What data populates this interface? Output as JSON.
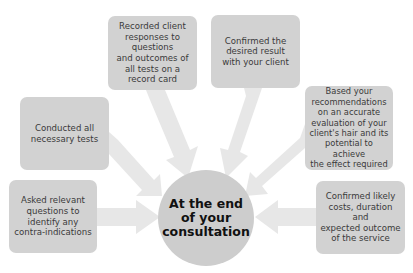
{
  "diagram": {
    "center": {
      "label": "At the end\nof your\nconsultation"
    },
    "nodes": [
      {
        "id": "record-card",
        "label": "Recorded client\nresponses to\nquestions\nand outcomes of\nall tests on a\nrecord card"
      },
      {
        "id": "desired-result",
        "label": "Confirmed the\ndesired result\nwith your client"
      },
      {
        "id": "recommendations",
        "label": "Based your\nrecommendations\non an accurate\nevaluation of your\nclient's hair and its\npotential to achieve\nthe effect required"
      },
      {
        "id": "costs",
        "label": "Confirmed likely\ncosts, duration and\nexpected outcome\nof the service"
      },
      {
        "id": "tests",
        "label": "Conducted all\nnecessary tests"
      },
      {
        "id": "contra-indications",
        "label": "Asked relevant\nquestions to\nidentify any\ncontra-indications"
      }
    ],
    "colors": {
      "box": "#d2d2d2",
      "hub": "#cdcdcd",
      "arrow": "#e6e6e6",
      "box_text": "#3a3a3a",
      "hub_text": "#111111"
    }
  }
}
